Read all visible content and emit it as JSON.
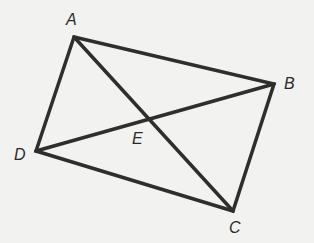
{
  "diagram": {
    "type": "quadrilateral-with-diagonals",
    "points": {
      "A": {
        "label": "A",
        "x": 74,
        "y": 37,
        "lx": 66,
        "ly": 25
      },
      "B": {
        "label": "B",
        "x": 274,
        "y": 84,
        "lx": 284,
        "ly": 89
      },
      "C": {
        "label": "C",
        "x": 233,
        "y": 211,
        "lx": 229,
        "ly": 233
      },
      "D": {
        "label": "D",
        "x": 36,
        "y": 151,
        "lx": 14,
        "ly": 160
      },
      "E": {
        "label": "E",
        "x": 147,
        "y": 118,
        "lx": 132,
        "ly": 144
      }
    },
    "edges": [
      [
        "A",
        "B"
      ],
      [
        "B",
        "C"
      ],
      [
        "C",
        "D"
      ],
      [
        "D",
        "A"
      ],
      [
        "A",
        "C"
      ],
      [
        "D",
        "B"
      ]
    ],
    "colors": {
      "line": "#2e2e2e",
      "background": "#f2f2f0"
    }
  }
}
